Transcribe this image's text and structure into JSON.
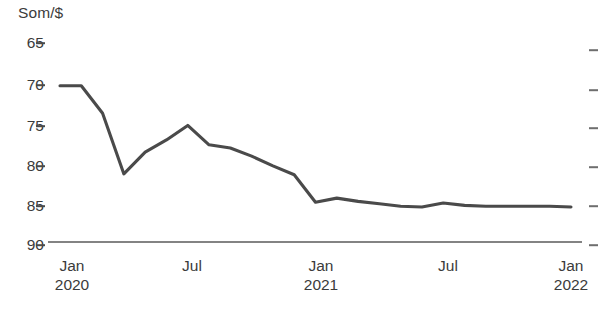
{
  "chart_data": {
    "type": "line",
    "title": "",
    "ylabel": "Som/$",
    "xlabel": "",
    "y_axis_inverted": true,
    "ylim": [
      65,
      90
    ],
    "y_ticks": [
      65,
      70,
      75,
      80,
      85,
      90
    ],
    "grid": false,
    "legend": null,
    "line_color": "#4a4a4a",
    "x_tick_labels": [
      {
        "month": "Jan",
        "year": "2020"
      },
      {
        "month": "Jul",
        "year": ""
      },
      {
        "month": "Jan",
        "year": "2021"
      },
      {
        "month": "Jul",
        "year": ""
      },
      {
        "month": "Jan",
        "year": "2022"
      }
    ],
    "x": [
      "2020-01",
      "2020-02",
      "2020-03",
      "2020-04",
      "2020-05",
      "2020-06",
      "2020-07",
      "2020-08",
      "2020-09",
      "2020-10",
      "2020-11",
      "2020-12",
      "2021-01",
      "2021-02",
      "2021-03",
      "2021-04",
      "2021-05",
      "2021-06",
      "2021-07",
      "2021-08",
      "2021-09",
      "2021-10",
      "2021-11",
      "2021-12",
      "2022-01"
    ],
    "series": [
      {
        "name": "Som per US dollar",
        "values": [
          70.3,
          70.3,
          73.7,
          81.2,
          78.5,
          77.0,
          75.2,
          77.6,
          78.0,
          79.0,
          80.2,
          81.3,
          84.7,
          84.2,
          84.6,
          84.9,
          85.2,
          85.3,
          84.8,
          85.1,
          85.2,
          85.2,
          85.2,
          85.2,
          85.3
        ]
      }
    ]
  }
}
